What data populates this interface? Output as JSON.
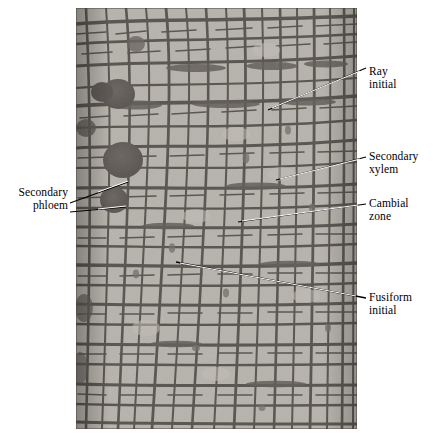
{
  "figure": {
    "type": "light-micrograph",
    "background_color": "#ffffff",
    "image_tone": {
      "cell_lumen": "#d8d4cc",
      "cell_wall": "#2b2724",
      "dark_cell": "#3a3531",
      "border": "#1c1916"
    }
  },
  "labels": {
    "secondary_phloem": "Secondary\nphloem",
    "ray_initial": "Ray\ninitial",
    "secondary_xylem": "Secondary\nxylem",
    "cambial_zone": "Cambial\nzone",
    "fusiform_initial": "Fusiform\ninitial"
  }
}
